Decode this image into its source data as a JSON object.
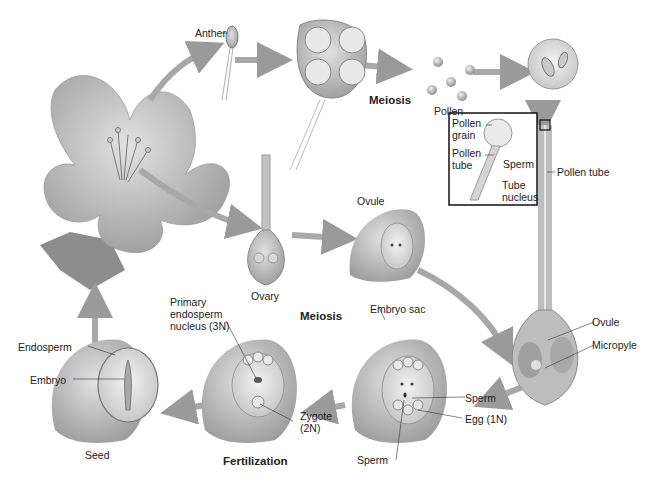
{
  "diagram": {
    "type": "angiosperm-life-cycle",
    "labels": {
      "anther": "Anther",
      "meiosis_top": "Meiosis",
      "pollen": "Pollen",
      "inset_pollen_grain": "Pollen\ngrain",
      "inset_pollen_tube": "Pollen\ntube",
      "inset_sperm": "Sperm",
      "inset_tube_nucleus": "Tube\nnucleus",
      "pollen_tube": "Pollen tube",
      "ovary": "Ovary",
      "ovule_top": "Ovule",
      "embryo_sac": "Embryo sac",
      "ovule_right": "Ovule",
      "micropyle": "Micropyle",
      "meiosis_mid": "Meiosis",
      "primary_endosperm": "Primary\nendosperm\nnucleus (3N)",
      "zygote": "Zygote\n(2N)",
      "sperm_right": "Sperm",
      "egg": "Egg (1N)",
      "sperm_bottom": "Sperm",
      "fertilization": "Fertilization",
      "endosperm": "Endosperm",
      "embryo": "Embryo",
      "seed": "Seed"
    },
    "colors": {
      "arrow": "#a9a9a9",
      "tissue": "#b5b5b5",
      "tissue_light": "#d9d9d9",
      "outline": "#6e6e6e",
      "text": "#222222"
    }
  }
}
